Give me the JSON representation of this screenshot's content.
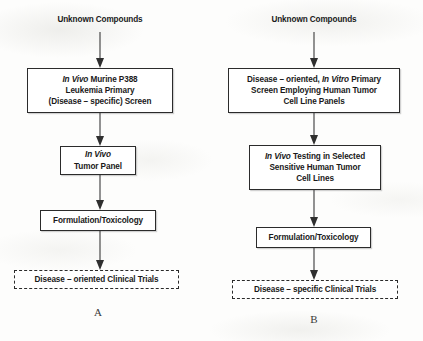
{
  "figure": {
    "type": "flowchart",
    "panels": [
      {
        "id": "A",
        "letter": "A",
        "entry_label": "Unknown Compounds",
        "steps": [
          {
            "name": "in-vivo-p388-screen",
            "lines": [
              [
                {
                  "t": "In Vivo",
                  "italic": true
                },
                {
                  "t": " Murine P388",
                  "italic": false
                }
              ],
              [
                {
                  "t": "Leukemia Primary",
                  "italic": false
                }
              ],
              [
                {
                  "t": "(Disease – specific) Screen",
                  "italic": false
                }
              ]
            ],
            "style": "solid"
          },
          {
            "name": "in-vivo-tumor-panel",
            "lines": [
              [
                {
                  "t": "In Vivo",
                  "italic": true
                }
              ],
              [
                {
                  "t": "Tumor Panel",
                  "italic": false
                }
              ]
            ],
            "style": "solid"
          },
          {
            "name": "formulation-toxicology",
            "lines": [
              [
                {
                  "t": "Formulation/Toxicology",
                  "italic": false
                }
              ]
            ],
            "style": "solid"
          },
          {
            "name": "disease-oriented-clinical-trials",
            "lines": [
              [
                {
                  "t": "Disease – oriented Clinical Trials",
                  "italic": false
                }
              ]
            ],
            "style": "dashed"
          }
        ]
      },
      {
        "id": "B",
        "letter": "B",
        "entry_label": "Unknown Compounds",
        "steps": [
          {
            "name": "in-vitro-primary-screen",
            "lines": [
              [
                {
                  "t": "Disease – oriented, ",
                  "italic": false
                },
                {
                  "t": "In Vitro",
                  "italic": true
                },
                {
                  "t": " Primary",
                  "italic": false
                }
              ],
              [
                {
                  "t": "Screen Employing Human Tumor",
                  "italic": false
                }
              ],
              [
                {
                  "t": "Cell Line Panels",
                  "italic": false
                }
              ]
            ],
            "style": "solid"
          },
          {
            "name": "in-vivo-testing-selected-cell-lines",
            "lines": [
              [
                {
                  "t": "In Vivo",
                  "italic": true
                },
                {
                  "t": " Testing in Selected",
                  "italic": false
                }
              ],
              [
                {
                  "t": "Sensitive Human Tumor",
                  "italic": false
                }
              ],
              [
                {
                  "t": "Cell Lines",
                  "italic": false
                }
              ]
            ],
            "style": "solid"
          },
          {
            "name": "formulation-toxicology",
            "lines": [
              [
                {
                  "t": "Formulation/Toxicology",
                  "italic": false
                }
              ]
            ],
            "style": "solid"
          },
          {
            "name": "disease-specific-clinical-trials",
            "lines": [
              [
                {
                  "t": "Disease – specific Clinical Trials",
                  "italic": false
                }
              ]
            ],
            "style": "dashed"
          }
        ]
      }
    ],
    "colors": {
      "stroke": "#2b2b2b",
      "arrow": "#2f2f2f",
      "text": "#1a1a1a",
      "background": "#fdfdfc"
    }
  }
}
